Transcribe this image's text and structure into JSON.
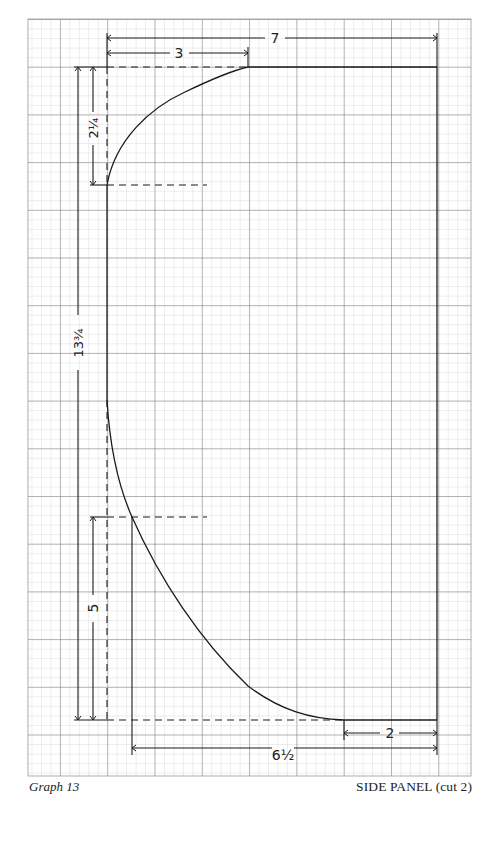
{
  "figure": {
    "caption_left": "Graph 13",
    "caption_right": "SIDE PANEL (cut 2)"
  },
  "dimensions": {
    "total_width": "7",
    "top_curve_width": "3",
    "top_curve_height": "2¼",
    "total_height": "13¾",
    "bottom_curve_height": "5",
    "bottom_curve_width": "6½",
    "bottom_straight": "2"
  },
  "colors": {
    "paper": "#ffffff",
    "grid_minor": "#b8b8b8",
    "grid_major": "#6e6e6e",
    "ink": "#1a1a1a"
  }
}
